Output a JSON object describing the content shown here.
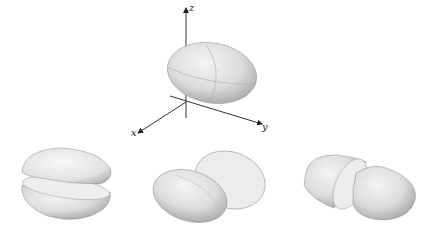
{
  "figure": {
    "axes": {
      "x_label": "x",
      "y_label": "y",
      "z_label": "z"
    },
    "panels": [
      {
        "name": "ellipsoid-whole",
        "description": "Whole ellipsoid centered at origin"
      },
      {
        "name": "split-horizontal",
        "description": "Ellipsoid split into top and bottom halves"
      },
      {
        "name": "split-along-long-axis",
        "description": "Ellipsoid split into front and back halves"
      },
      {
        "name": "split-across-long-axis",
        "description": "Ellipsoid split into left and right halves"
      }
    ]
  }
}
